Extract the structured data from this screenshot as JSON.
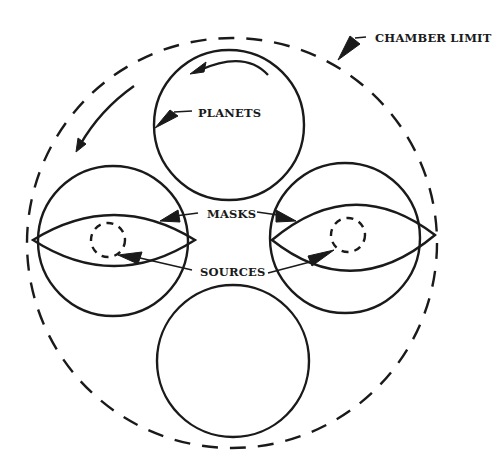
{
  "diagram": {
    "colors": {
      "ink": "#1a1a1a",
      "background": "#ffffff"
    },
    "labels": {
      "chamber_limit": "CHAMBER LIMIT",
      "planets": "PLANETS",
      "masks": "MASKS",
      "sources": "SOURCES"
    },
    "elements": {
      "chamber_limit": {
        "shape": "dashed-circle",
        "cx": 232,
        "cy": 243,
        "r": 205
      },
      "planets": [
        {
          "position": "top",
          "cx": 229,
          "cy": 125,
          "r": 75
        },
        {
          "position": "left",
          "cx": 113,
          "cy": 241,
          "r": 75
        },
        {
          "position": "right",
          "cx": 345,
          "cy": 238,
          "r": 75
        },
        {
          "position": "bottom",
          "cx": 233,
          "cy": 361,
          "r": 76
        }
      ],
      "masks": [
        {
          "position": "left",
          "shape": "lens"
        },
        {
          "position": "right",
          "shape": "lens"
        }
      ],
      "sources": [
        {
          "position": "left",
          "shape": "dashed-circle",
          "cx": 108,
          "cy": 240,
          "r": 17
        },
        {
          "position": "right",
          "shape": "dashed-circle",
          "cx": 348,
          "cy": 235,
          "r": 17
        }
      ],
      "rotation_arrows": [
        "planet-rotation-counterclockwise",
        "chamber-rotation-counterclockwise"
      ]
    }
  }
}
